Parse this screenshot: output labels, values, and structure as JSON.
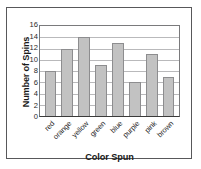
{
  "chart_data": {
    "type": "bar",
    "title": "",
    "subtitle": "",
    "xlabel": "Color Spun",
    "ylabel": "Number of Spins",
    "categories": [
      "red",
      "orange",
      "yellow",
      "green",
      "blue",
      "purple",
      "pink",
      "brown"
    ],
    "values": [
      8,
      12,
      14,
      9,
      13,
      6,
      11,
      7
    ],
    "ylim": [
      0,
      16
    ],
    "ytick_step": 2,
    "yticks": [
      16,
      14,
      12,
      10,
      8,
      6,
      4,
      2,
      0
    ],
    "grid": true,
    "grid_axis": "y",
    "legend": null,
    "legend_position": "none",
    "xtick_rotation": -45,
    "annotations": []
  },
  "style": {
    "bar_fill": "#c2c2c2",
    "bar_edge": "#8d8d8f",
    "grid_color": "#b9b9bb",
    "axis_color": "#3a3a3a",
    "frame_color": "#58585a",
    "plot_background": "#ffffff",
    "figure_background": "#ffffff",
    "text_color": "#1a1a1a"
  }
}
